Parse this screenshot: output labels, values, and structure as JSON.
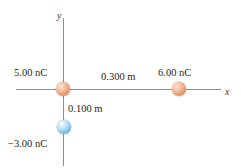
{
  "figure": {
    "type": "physics-diagram",
    "background_color": "#ffffff",
    "axes": {
      "x_label": "x",
      "y_label": "y",
      "axis_color": "#8e8e92"
    },
    "charges": [
      {
        "id": "q1",
        "label": "5.00 nC",
        "sign": "positive",
        "color": "#e89f77",
        "position_label": "origin"
      },
      {
        "id": "q2",
        "label": "6.00 nC",
        "sign": "positive",
        "color": "#e89f77",
        "position_label": "on positive x-axis"
      },
      {
        "id": "q3",
        "label": "−3.00 nC",
        "sign": "negative",
        "color": "#59ade4",
        "position_label": "on negative y-axis"
      }
    ],
    "distances": [
      {
        "id": "d1",
        "label": "0.300 m",
        "between": "q1-q2",
        "orientation": "horizontal"
      },
      {
        "id": "d2",
        "label": "0.100 m",
        "between": "q1-q3",
        "orientation": "vertical"
      }
    ]
  }
}
